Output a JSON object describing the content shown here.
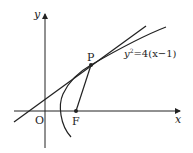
{
  "diagram": {
    "axes": {
      "x_label": "x",
      "y_label": "y",
      "origin_label": "O"
    },
    "points": {
      "P": "P",
      "F": "F"
    },
    "curve_label": {
      "base": "y",
      "sup": "2",
      "rest": "=4(x−1)"
    },
    "colors": {
      "stroke": "#222222",
      "background": "#ffffff"
    }
  }
}
